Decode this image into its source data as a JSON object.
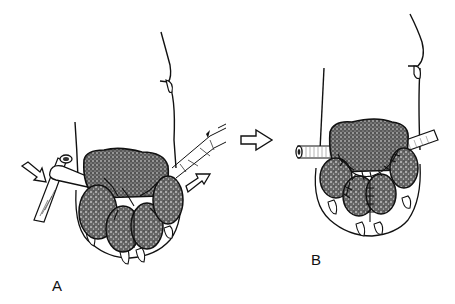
{
  "figure": {
    "panels": [
      {
        "id": "A",
        "label": "A",
        "description": "Paw pad with pads being sutured; tube drains passed through with arrows indicating rotation/pull direction"
      },
      {
        "id": "B",
        "label": "B",
        "description": "Paw pad after suturing with drain tube in place"
      }
    ],
    "transition_arrow": "right-arrow-icon",
    "colors": {
      "ink": "#111111",
      "background": "#ffffff",
      "stipple": "#333333"
    }
  }
}
